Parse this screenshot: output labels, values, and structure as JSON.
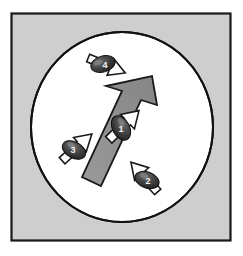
{
  "figure": {
    "caption": "",
    "frame": {
      "border_color": "#1a1a1a",
      "fill_color": "#c9c9c9",
      "x": 11,
      "y": 13,
      "width": 220,
      "height": 228
    },
    "arena": {
      "name": "circular-arena",
      "fill_color": "#ffffff",
      "stroke_color": "#111111",
      "cx": 122,
      "cy": 127,
      "rx": 91,
      "ry": 95
    },
    "main_arrow": {
      "name": "group-heading-arrow",
      "label": "",
      "fill_color": "#8c8c8c",
      "stroke_color": "#1a1a1a",
      "direction": "north-east",
      "tip_x": 152,
      "tip_y": 77,
      "tail_x": 88,
      "tail_y": 185
    },
    "agents": [
      {
        "id": "agent-4",
        "label": "4",
        "x": 103,
        "y": 64,
        "body_rotation": -18,
        "arrow_rotation": 22,
        "arrow_direction": "south-east",
        "body_color": "#3a3a3a",
        "arrow_fill": "#ffffff",
        "arrow_stroke": "#1a1a1a"
      },
      {
        "id": "agent-1",
        "label": "1",
        "x": 121,
        "y": 128,
        "body_rotation": 62,
        "arrow_rotation": -44,
        "arrow_direction": "north-east",
        "body_color": "#3a3a3a",
        "arrow_fill": "#ffffff",
        "arrow_stroke": "#1a1a1a"
      },
      {
        "id": "agent-3",
        "label": "3",
        "x": 74,
        "y": 150,
        "body_rotation": 28,
        "arrow_rotation": -42,
        "arrow_direction": "north-east",
        "body_color": "#3a3a3a",
        "arrow_fill": "#ffffff",
        "arrow_stroke": "#1a1a1a"
      },
      {
        "id": "agent-2",
        "label": "2",
        "x": 147,
        "y": 180,
        "body_rotation": 20,
        "arrow_rotation": -132,
        "arrow_direction": "north-west",
        "body_color": "#3a3a3a",
        "arrow_fill": "#ffffff",
        "arrow_stroke": "#1a1a1a"
      }
    ],
    "colors": {
      "background": "#ffffff",
      "panel_gray": "#c9c9c9",
      "arrow_gray": "#8c8c8c",
      "agent_dark": "#3a3a3a",
      "outline": "#1a1a1a"
    }
  }
}
